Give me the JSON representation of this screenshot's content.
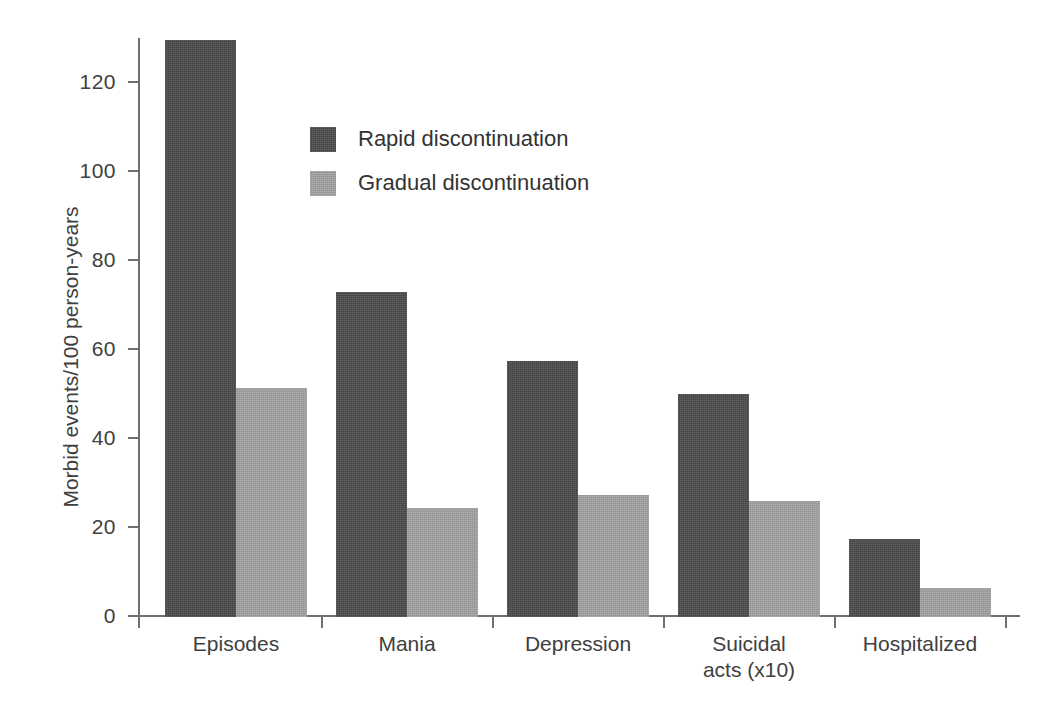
{
  "chart_data": {
    "type": "bar",
    "title": "",
    "xlabel": "",
    "ylabel": "Morbid events/100 person-years",
    "ylim": [
      0,
      130
    ],
    "yticks": [
      0,
      20,
      40,
      60,
      80,
      100,
      120
    ],
    "ytick_labels": [
      "0",
      "20",
      "40",
      "60",
      "80",
      "100",
      "120"
    ],
    "grid": false,
    "legend_position": "upper center",
    "categories": [
      "Episodes",
      "Mania",
      "Depression",
      "Suicidal\nacts (x10)",
      "Hospitalized"
    ],
    "series": [
      {
        "name": "Rapid discontinuation",
        "color": "#4b4b4b",
        "values": [
          129.5,
          73,
          57.5,
          50,
          17.5
        ]
      },
      {
        "name": "Gradual discontinuation",
        "color": "#a2a2a2",
        "values": [
          51.5,
          24.5,
          27.5,
          26,
          6.5
        ]
      }
    ]
  },
  "legend": {
    "items": [
      {
        "label": "Rapid discontinuation",
        "color": "#4b4b4b"
      },
      {
        "label": "Gradual discontinuation",
        "color": "#a2a2a2"
      }
    ]
  },
  "axis": {
    "y_title": "Morbid events/100 person-years",
    "y_tick_labels": [
      "120",
      "100",
      "80",
      "60",
      "40",
      "20",
      "0"
    ],
    "x_tick_labels": [
      "Episodes",
      "Mania",
      "Depression",
      "Suicidal\nacts (x10)",
      "Hospitalized"
    ]
  },
  "colors": {
    "rapid": "#4b4b4b",
    "gradual": "#a2a2a2",
    "axis": "#6f6f6f",
    "text": "#404040",
    "background": "#ffffff"
  }
}
